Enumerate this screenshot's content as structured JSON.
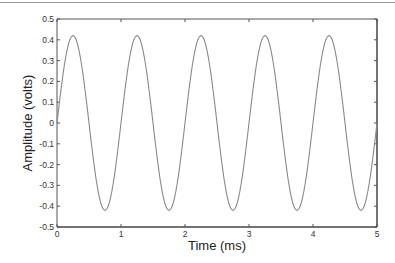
{
  "chart_data": {
    "type": "line",
    "title": "",
    "xlabel": "Time (ms)",
    "ylabel": "Amplitude (volts)",
    "xlim": [
      0,
      5
    ],
    "ylim": [
      -0.5,
      0.5
    ],
    "xticks": [
      0,
      1,
      2,
      3,
      4,
      5
    ],
    "xtick_labels": [
      "0",
      "1",
      "2",
      "3",
      "4",
      "5"
    ],
    "yticks": [
      0.5,
      0.4,
      0.3,
      0.2,
      0.1,
      0,
      -0.1,
      -0.2,
      -0.3,
      -0.4,
      -0.5
    ],
    "ytick_labels": [
      "0.5",
      "0.4",
      "0.3",
      "0.2",
      "0.1",
      "0",
      "-0.1",
      "-0.2",
      "-0.3",
      "-0.4",
      "-0.5"
    ],
    "grid": false,
    "legend": null,
    "series": [
      {
        "name": "signal",
        "description": "sine wave, amplitude ~0.42 V, frequency 1 kHz (period 1 ms), starting at 0",
        "amplitude": 0.42,
        "period_ms": 1,
        "phase": 0,
        "x": [
          0,
          0.25,
          0.5,
          0.75,
          1,
          1.25,
          1.5,
          1.75,
          2,
          2.25,
          2.5,
          2.75,
          3,
          3.25,
          3.5,
          3.75,
          4,
          4.25,
          4.5,
          4.75,
          5
        ],
        "values": [
          0,
          0.42,
          0,
          -0.42,
          0,
          0.42,
          0,
          -0.42,
          0,
          0.42,
          0,
          -0.42,
          0,
          0.42,
          0,
          -0.42,
          0,
          0.42,
          0,
          -0.42,
          0
        ],
        "color": "#8a8a8a"
      }
    ]
  }
}
